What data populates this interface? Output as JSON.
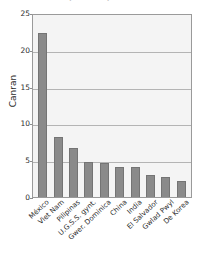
{
  "chart_data": {
    "type": "bar",
    "title": "Cyfran o'r cyfanswm",
    "xlabel": "",
    "ylabel": "Canran",
    "ylim": [
      0,
      25
    ],
    "yticks": [
      0,
      5,
      10,
      15,
      20,
      25
    ],
    "grid": true,
    "legend": null,
    "bar_color": "#8a8a8a",
    "plot_background": "#f4f4f4",
    "categories": [
      "México",
      "Viet Nam",
      "Pilipinas",
      "U.G.S.S. gynt.",
      "Gwer. Dominica",
      "China",
      "India",
      "El Salvador",
      "Gwlad Pwyl",
      "De Korea"
    ],
    "values": [
      22.3,
      8.2,
      6.7,
      4.8,
      4.6,
      4.1,
      4.1,
      3.0,
      2.7,
      2.2
    ]
  }
}
